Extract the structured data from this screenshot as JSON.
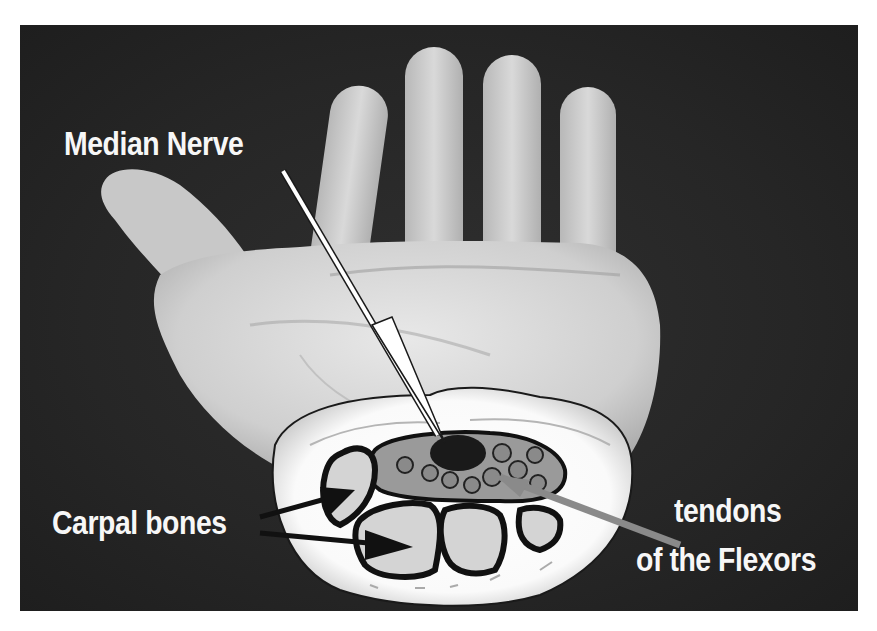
{
  "figure": {
    "background_color": "#262626",
    "label_color": "#f7f7f7",
    "labels": {
      "median_nerve": "Median Nerve",
      "carpal_bones": "Carpal bones",
      "tendons_line1": "tendons",
      "tendons_line2": "of the Flexors"
    },
    "arrows": [
      {
        "name": "median-nerve-arrow",
        "color": "#ffffff",
        "target": "median nerve"
      },
      {
        "name": "carpal-bones-arrow-upper",
        "color": "#111111",
        "target": "carpal bone"
      },
      {
        "name": "carpal-bones-arrow-lower",
        "color": "#111111",
        "target": "carpal bone"
      },
      {
        "name": "flexor-tendons-arrow",
        "color": "#8a8a8a",
        "target": "flexor tendons"
      }
    ]
  }
}
